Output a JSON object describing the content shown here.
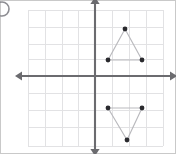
{
  "figure": {
    "label": "D)",
    "width": 176,
    "height": 154,
    "background_color": "#ffffff",
    "border_color": "#c9c9c9"
  },
  "corner_label": {
    "name": "choice-label",
    "text": "D)",
    "note": "partially cropped circular glyph at top-left corner",
    "color": "#8d8d92",
    "center_x": 2,
    "center_y": 9,
    "radius": 7
  },
  "grid": {
    "visible": true,
    "color": "#e2e2e4",
    "cell_size_px": 17,
    "left": 28,
    "right": 163,
    "top": 10,
    "bottom": 146,
    "vertical_lines_x": [
      28,
      45,
      62,
      78,
      95,
      112,
      129,
      146,
      163
    ],
    "horizontal_lines_y": [
      10,
      27,
      44,
      59,
      76,
      93,
      110,
      127,
      146
    ]
  },
  "axes": {
    "color": "#6b6b6f",
    "stroke_width": 2.1,
    "origin_x": 95,
    "origin_y": 76,
    "x_axis": {
      "label": "x-axis",
      "start_x": 22,
      "end_x": 170,
      "y": 76,
      "arrow_left": true,
      "arrow_right": true
    },
    "y_axis": {
      "label": "y-axis",
      "x": 95,
      "start_y": 4,
      "end_y": 149,
      "arrow_up": true,
      "arrow_down": true
    },
    "tick_labels": [],
    "axis_titles": []
  },
  "chart_data": {
    "type": "scatter",
    "title": "",
    "subtitle": "",
    "xlabel": "",
    "ylabel": "",
    "xlim": [
      -4,
      4
    ],
    "ylim": [
      -4,
      4
    ],
    "grid": true,
    "legend": null,
    "annotations": [],
    "tick_labels_shown": false,
    "unit_px": 17,
    "origin_px": [
      95,
      76
    ],
    "shapes": [
      {
        "name": "upper-triangle",
        "description": "triangle pointing up, located above the x-axis in quadrant I",
        "closed": true,
        "edge_color": "#b9b9bd",
        "vertex_color": "#2a2a2e",
        "vertices_px": [
          [
            125,
            29
          ],
          [
            108,
            60
          ],
          [
            142,
            60
          ]
        ],
        "vertices_data": [
          [
            1.8,
            2.8
          ],
          [
            0.8,
            0.9
          ],
          [
            2.8,
            0.9
          ]
        ]
      },
      {
        "name": "lower-triangle",
        "description": "triangle pointing down, located below the x-axis in quadrant IV",
        "closed": true,
        "edge_color": "#b9b9bd",
        "vertex_color": "#2a2a2e",
        "vertices_px": [
          [
            108,
            108
          ],
          [
            142,
            108
          ],
          [
            127,
            140
          ]
        ],
        "vertices_data": [
          [
            0.8,
            -1.9
          ],
          [
            2.8,
            -1.9
          ],
          [
            1.9,
            -3.8
          ]
        ]
      }
    ],
    "points_px": [
      [
        125,
        29
      ],
      [
        108,
        60
      ],
      [
        142,
        60
      ],
      [
        108,
        108
      ],
      [
        142,
        108
      ],
      [
        127,
        140
      ]
    ],
    "point_radius_px": 2.4
  }
}
